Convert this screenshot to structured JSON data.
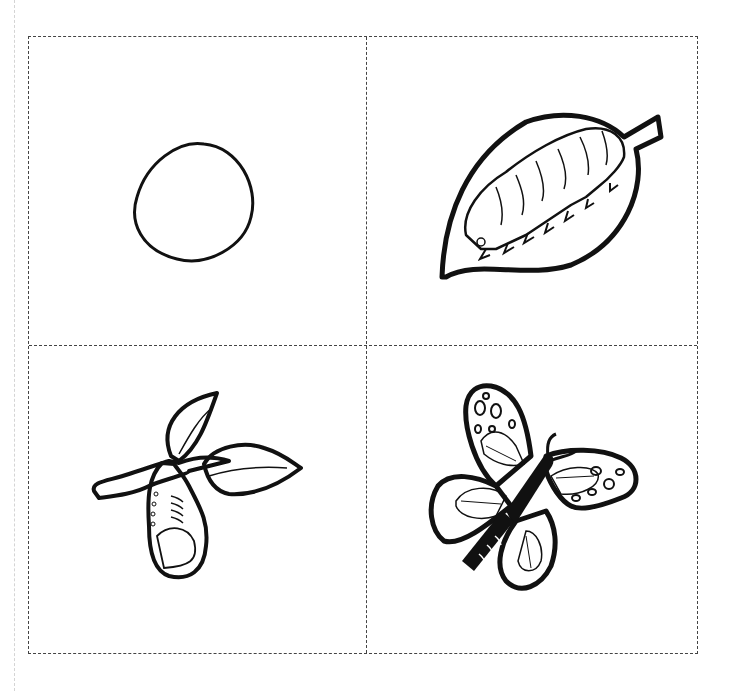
{
  "worksheet": {
    "title": "Butterfly life cycle cut-out cards",
    "cells": [
      {
        "stage": "egg",
        "position": "top-left"
      },
      {
        "stage": "caterpillar",
        "position": "top-right"
      },
      {
        "stage": "chrysalis",
        "position": "bottom-left"
      },
      {
        "stage": "butterfly",
        "position": "bottom-right"
      }
    ],
    "colors": {
      "line": "#111111",
      "cut_line": "#444444",
      "background": "#ffffff"
    }
  }
}
